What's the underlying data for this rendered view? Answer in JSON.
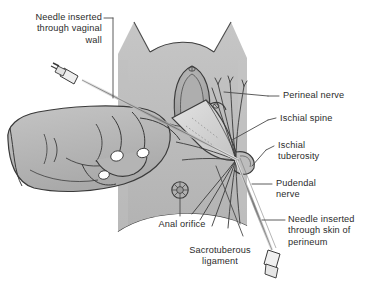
{
  "figure": {
    "background_color": "#ffffff",
    "body_fill": "#b5b5b5",
    "body_fill_light": "#c9c9c9",
    "ink_color": "#2b2b2b",
    "nail_color": "#ffffff",
    "width": 369,
    "height": 291
  },
  "labels": {
    "needle_vaginal": "Needle inserted\nthrough vaginal\nwall",
    "perineal_nerve": "Perineal nerve",
    "ischial_spine": "Ischial spine",
    "ischial_tuberosity": "Ischial\ntuberosity",
    "pudendal_nerve": "Pudendal\nnerve",
    "needle_perineum": "Needle inserted\nthrough skin of\nperineum",
    "anal_orifice": "Anal orifice",
    "sacrotuberous_ligament": "Sacrotuberous\nligament"
  },
  "structures": {
    "vaginal_opening": "vaginal-opening",
    "ischial_spine": "ischial-spine",
    "ischial_tuberosity": "ischial-tuberosity",
    "sacrotuberous_ligament": "sacrotuberous-ligament",
    "pudendal_nerve_trunk": "pudendal-nerve-trunk",
    "perineal_nerve_branch": "perineal-nerve-branch",
    "anal_orifice": "anal-orifice",
    "examining_hand": "examining-hand",
    "thigh_left": "thigh-left",
    "thigh_right": "thigh-right",
    "syringe_vaginal": "syringe-vaginal-route",
    "syringe_perineal": "syringe-perineal-route"
  }
}
